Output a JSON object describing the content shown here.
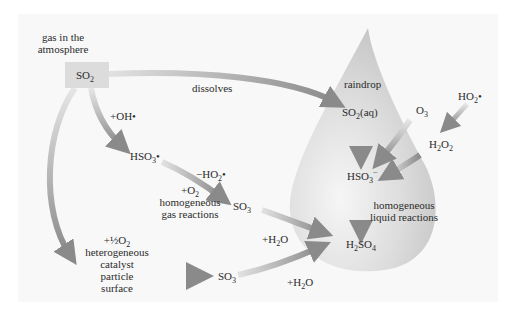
{
  "diagram": {
    "colors": {
      "background_band": "#f7f7f7",
      "drop_light": "#f4f4f4",
      "drop_dark": "#c9c9c9",
      "arrow": "#8c8c8c",
      "box": "#dcdcdc",
      "text": "#2b2b2b"
    },
    "labels": {
      "gas_line1": "gas in the",
      "gas_line2": "atmosphere",
      "so2_box": "SO",
      "so2_box_sub": "2",
      "dissolves": "dissolves",
      "raindrop": "raindrop",
      "so2aq_a": "SO",
      "so2aq_sub": "2",
      "so2aq_b": "(aq)",
      "o3_a": "O",
      "o3_sub": "3",
      "ho2_a": "HO",
      "ho2_sub": "2",
      "ho2_dot": "•",
      "h2o2_a": "H",
      "h2o2_sub1": "2",
      "h2o2_b": "O",
      "h2o2_sub2": "2",
      "plus_oh": "+OH•",
      "hso3rad_a": "HSO",
      "hso3rad_sub": "3",
      "hso3rad_dot": "•",
      "minus_ho2_a": "−HO",
      "minus_ho2_sub": "2",
      "minus_ho2_dot": "•",
      "plus_o2_a": "+O",
      "plus_o2_sub": "2",
      "homog_gas_1": "homogeneous",
      "homog_gas_2": "gas reactions",
      "so3_upper_a": "SO",
      "so3_upper_sub": "3",
      "hso3ion_a": "HSO",
      "hso3ion_sub": "3",
      "hso3ion_sup": "−",
      "homog_liq_1": "homogeneous",
      "homog_liq_2": "liquid reactions",
      "plus_h2o_upper_a": "+H",
      "plus_h2o_upper_sub": "2",
      "plus_h2o_upper_b": "O",
      "h2so4_a": "H",
      "h2so4_sub1": "2",
      "h2so4_b": "SO",
      "h2so4_sub2": "4",
      "half_o2_a": "+½O",
      "half_o2_sub": "2",
      "hetero_1": "heterogeneous",
      "hetero_2": "catalyst",
      "hetero_3": "particle",
      "hetero_4": "surface",
      "so3_lower_a": "SO",
      "so3_lower_sub": "3",
      "plus_h2o_lower_a": "+H",
      "plus_h2o_lower_sub": "2",
      "plus_h2o_lower_b": "O"
    }
  }
}
